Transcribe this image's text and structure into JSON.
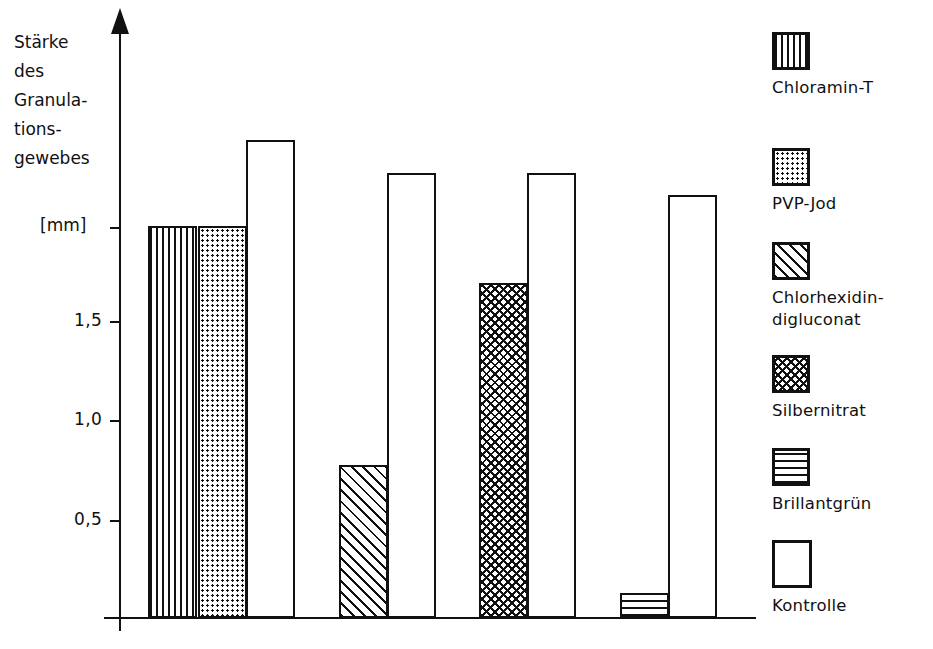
{
  "chart_data": {
    "type": "bar",
    "title": "",
    "xlabel": "",
    "ylabel": "Stärke des Granulations- gewebes [mm]",
    "ylim": [
      0,
      2.6
    ],
    "grid": false,
    "legend_position": "right",
    "y_axis": {
      "unit": "[mm]",
      "tick_labels": [
        "1,5",
        "1,0",
        "0,5"
      ],
      "tick_values": [
        1.5,
        1.0,
        0.5
      ]
    },
    "y_title_lines": [
      "Stärke",
      "des",
      "Granula-",
      "tions-",
      "gewebes"
    ],
    "categories": [
      "Chloramin-T",
      "PVP-Jod",
      "Kontrolle",
      "Chlorhexidin-digluconat",
      "Kontrolle",
      "Silbernitrat",
      "Kontrolle",
      "Brillantgrün",
      "Kontrolle"
    ],
    "values": [
      2.0,
      2.0,
      2.44,
      0.78,
      2.27,
      1.71,
      2.27,
      0.13,
      2.16
    ],
    "bars": [
      {
        "name": "Chloramin-T",
        "value": 2.0,
        "pattern": "vertical-lines",
        "group": 1
      },
      {
        "name": "PVP-Jod",
        "value": 2.0,
        "pattern": "dots",
        "group": 1
      },
      {
        "name": "Kontrolle",
        "value": 2.44,
        "pattern": "empty",
        "group": 1
      },
      {
        "name": "Chlorhexidin-digluconat",
        "value": 0.78,
        "pattern": "diagonal-hatch",
        "group": 2
      },
      {
        "name": "Kontrolle",
        "value": 2.27,
        "pattern": "empty",
        "group": 2
      },
      {
        "name": "Silbernitrat",
        "value": 1.71,
        "pattern": "cross-hatch",
        "group": 3
      },
      {
        "name": "Kontrolle",
        "value": 2.27,
        "pattern": "empty",
        "group": 3
      },
      {
        "name": "Brillantgrün",
        "value": 0.13,
        "pattern": "horizontal-lines",
        "group": 4
      },
      {
        "name": "Kontrolle",
        "value": 2.16,
        "pattern": "empty",
        "group": 4
      }
    ],
    "legend": [
      {
        "label": "Chloramin-T",
        "pattern": "vertical-lines"
      },
      {
        "label": "PVP-Jod",
        "pattern": "dots"
      },
      {
        "label": "Chlorhexidin-digluconat",
        "pattern": "diagonal-hatch"
      },
      {
        "label": "Silbernitrat",
        "pattern": "cross-hatch"
      },
      {
        "label": "Brillantgrün",
        "pattern": "horizontal-lines"
      },
      {
        "label": "Kontrolle",
        "pattern": "empty"
      }
    ],
    "colors": {
      "ink": "#111111",
      "background": "#ffffff"
    }
  }
}
